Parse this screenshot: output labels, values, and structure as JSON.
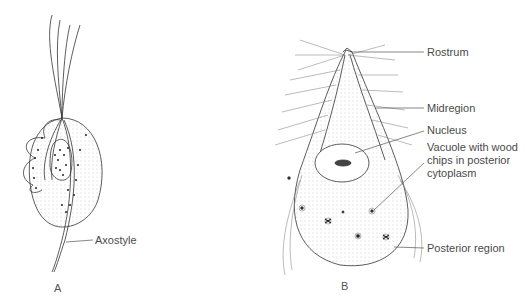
{
  "figure_a": {
    "panel_label": "A",
    "labels": {
      "axostyle": "Axostyle"
    }
  },
  "figure_b": {
    "panel_label": "B",
    "labels": {
      "rostrum": "Rostrum",
      "midregion": "Midregion",
      "nucleus": "Nucleus",
      "vacuole_line1": "Vacuole with wood",
      "vacuole_line2": "chips in posterior",
      "vacuole_line3": "cytoplasm",
      "posterior": "Posterior region"
    }
  },
  "colors": {
    "ink": "#333333",
    "stipple": "#bbbbbb",
    "label": "#4a4a4a"
  }
}
